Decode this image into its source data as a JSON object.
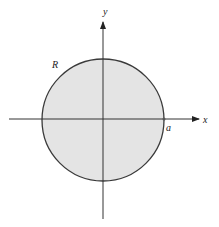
{
  "figure": {
    "type": "circle-region-diagram",
    "region_label": "R",
    "x_axis_label": "x",
    "y_axis_label": "y",
    "radius_label": "a",
    "colors": {
      "region_fill": "#e4e4e4",
      "stroke": "#3a3a3a",
      "axis": "#333333",
      "background": "#ffffff"
    }
  }
}
